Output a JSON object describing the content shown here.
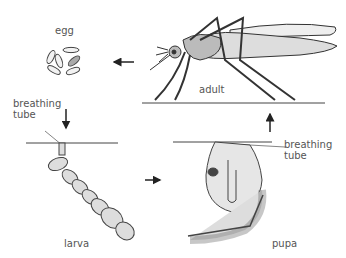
{
  "diagram": {
    "stages": [
      {
        "id": "egg",
        "label": "egg"
      },
      {
        "id": "larva",
        "label": "larva"
      },
      {
        "id": "pupa",
        "label": "pupa"
      },
      {
        "id": "adult",
        "label": "adult"
      }
    ],
    "annotations": {
      "larva_breathing_tube": [
        "breathing",
        "tube"
      ],
      "pupa_breathing_tube": [
        "breathing",
        "tube"
      ]
    },
    "cycle_order": [
      "egg",
      "larva",
      "pupa",
      "adult",
      "egg"
    ],
    "colors": {
      "line": "#333333",
      "body_fill": "#d8d8d8",
      "text": "#555555"
    }
  }
}
